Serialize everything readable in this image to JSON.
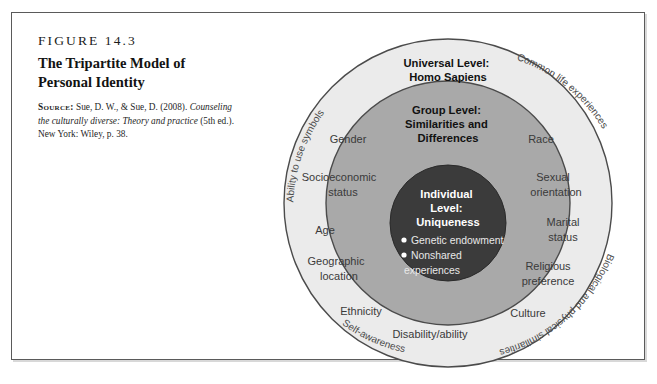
{
  "figure": {
    "number": "FIGURE 14.3",
    "title_line1": "The Tripartite Model of",
    "title_line2": "Personal Identity",
    "source_label": "Source:",
    "source_text_1": " Sue, D. W., & Sue, D. (2008).",
    "source_italic": "Counseling the culturally diverse: Theory and practice",
    "source_text_2": " (5th ed.). New York: Wiley, p. 38."
  },
  "diagram": {
    "levels": {
      "universal": {
        "line1": "Universal Level:",
        "line2": "Homo Sapiens"
      },
      "group": {
        "line1": "Group Level:",
        "line2": "Similarities and",
        "line3": "Differences"
      },
      "individual": {
        "line1": "Individual",
        "line2": "Level:",
        "line3": "Uniqueness"
      }
    },
    "individual_items": [
      "Genetic endowment",
      "Nonshared",
      "experiences"
    ],
    "group_items_left": [
      {
        "label": "Gender",
        "x": 85,
        "y": 112
      },
      {
        "label": "Socioeconomic",
        "x": 73,
        "y": 152
      },
      {
        "label": "status",
        "x": 96,
        "y": 167
      },
      {
        "label": "Age",
        "x": 66,
        "y": 203
      },
      {
        "label": "Geographic",
        "x": 70,
        "y": 233
      },
      {
        "label": "location",
        "x": 83,
        "y": 248
      },
      {
        "label": "Ethnicity",
        "x": 96,
        "y": 283
      },
      {
        "label": "Disability/ability",
        "x": 148,
        "y": 305
      }
    ],
    "group_items_right": [
      {
        "label": "Race",
        "x": 259,
        "y": 112
      },
      {
        "label": "Sexual",
        "x": 265,
        "y": 150
      },
      {
        "label": "orientation",
        "x": 253,
        "y": 165
      },
      {
        "label": "Marital",
        "x": 272,
        "y": 195
      },
      {
        "label": "status",
        "x": 276,
        "y": 210
      },
      {
        "label": "Religious",
        "x": 256,
        "y": 239
      },
      {
        "label": "preference",
        "x": 251,
        "y": 254
      },
      {
        "label": "Culture",
        "x": 251,
        "y": 287
      }
    ],
    "outer_items": [
      "Ability to use symbols",
      "Common life experiences",
      "Biological and physical similarities",
      "Self-awareness"
    ],
    "colors": {
      "outer_ring": "#e9e9e9",
      "group_ring": "#a8a8a8",
      "inner_circle": "#3a3a3a",
      "ring_stroke": "#4b4b4b"
    }
  }
}
